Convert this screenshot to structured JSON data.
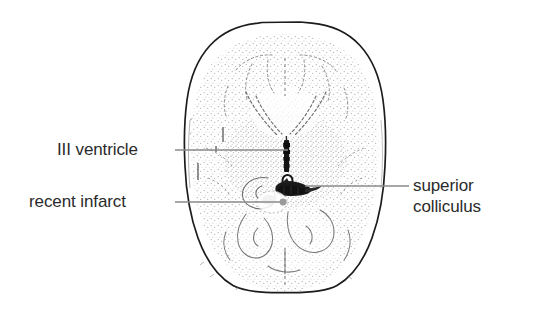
{
  "figure": {
    "type": "axial-brain-ct-line-drawing",
    "background_color": "#ffffff",
    "outline_color": "#1a1a1a",
    "stipple_color": "#8c8c8c",
    "lesion_color": "#111111",
    "leader_line_color": "#8a8a8a"
  },
  "annotations": [
    {
      "id": "iii-ventricle",
      "label": "III ventricle",
      "side": "left",
      "leader_y": 150,
      "leader_x_start": 175,
      "leader_x_end": 288
    },
    {
      "id": "recent-infarct",
      "label": "recent infarct",
      "side": "left",
      "leader_y": 202,
      "leader_x_start": 175,
      "leader_x_end": 284
    },
    {
      "id": "superior-colliculus",
      "label_line_1": "superior",
      "label_line_2": "colliculus",
      "side": "right",
      "leader_y": 186,
      "leader_x_start": 305,
      "leader_x_end": 409
    }
  ],
  "labels": {
    "iii_ventricle": "III ventricle",
    "recent_infarct": "recent infarct",
    "superior": "superior",
    "colliculus": "colliculus"
  }
}
